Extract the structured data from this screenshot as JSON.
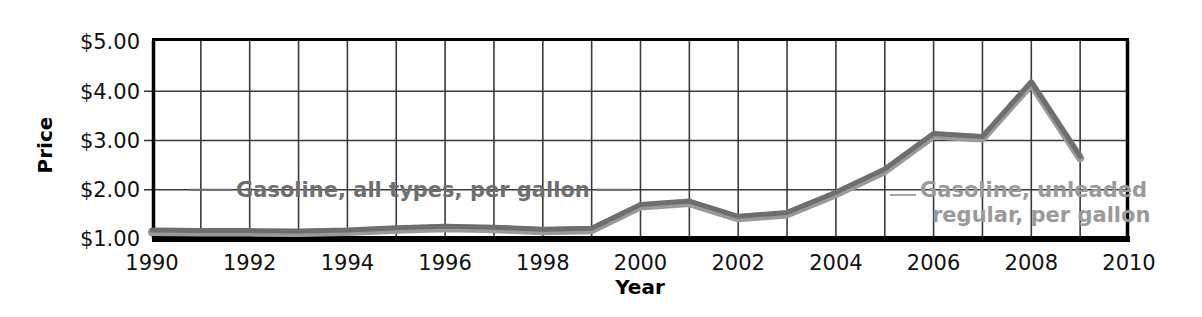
{
  "chart_data": {
    "type": "line",
    "title": "",
    "xlabel": "Year",
    "ylabel": "Price",
    "xlim": [
      1990,
      2010
    ],
    "ylim": [
      1.0,
      5.0
    ],
    "xticks": [
      "1990",
      "1992",
      "1994",
      "1996",
      "1998",
      "2000",
      "2002",
      "2004",
      "2006",
      "2008",
      "2010"
    ],
    "yticks": [
      "$1.00",
      "$2.00",
      "$3.00",
      "$4.00",
      "$5.00"
    ],
    "grid": true,
    "legend_position": "inline-annotations",
    "x": [
      1990,
      1991,
      1992,
      1993,
      1994,
      1995,
      1996,
      1997,
      1998,
      1999,
      2000,
      2001,
      2002,
      2003,
      2004,
      2005,
      2006,
      2007,
      2008,
      2009
    ],
    "series": [
      {
        "name": "Gasoline, all types, per gallon",
        "color": "#6e6e6e",
        "values": [
          1.16,
          1.14,
          1.13,
          1.11,
          1.12,
          1.15,
          1.23,
          1.23,
          1.06,
          1.17,
          1.51,
          1.46,
          1.36,
          1.59,
          1.88,
          2.3,
          2.59,
          2.8,
          3.27,
          2.35
        ]
      },
      {
        "name": "Gasoline, unleaded regular, per gallon",
        "color": "#9a9a9a",
        "values": [
          1.16,
          1.14,
          1.13,
          1.11,
          1.11,
          1.15,
          1.23,
          1.23,
          1.06,
          1.17,
          1.51,
          1.46,
          1.36,
          1.59,
          1.88,
          2.3,
          2.59,
          2.8,
          3.27,
          2.35
        ]
      }
    ],
    "plot_points": {
      "series_a": [
        {
          "year": 1990,
          "price": 1.16
        },
        {
          "year": 1991,
          "price": 1.15
        },
        {
          "year": 1992,
          "price": 1.15
        },
        {
          "year": 1993,
          "price": 1.14
        },
        {
          "year": 1994,
          "price": 1.16
        },
        {
          "year": 1995,
          "price": 1.21
        },
        {
          "year": 1996,
          "price": 1.24
        },
        {
          "year": 1997,
          "price": 1.22
        },
        {
          "year": 1998,
          "price": 1.18
        },
        {
          "year": 1999,
          "price": 1.2
        },
        {
          "year": 2000,
          "price": 1.68
        },
        {
          "year": 2001,
          "price": 1.75
        },
        {
          "year": 2002,
          "price": 1.44
        },
        {
          "year": 2003,
          "price": 1.52
        },
        {
          "year": 2004,
          "price": 1.93
        },
        {
          "year": 2005,
          "price": 2.4
        },
        {
          "year": 2006,
          "price": 3.12
        },
        {
          "year": 2007,
          "price": 3.06
        },
        {
          "year": 2008,
          "price": 4.17
        },
        {
          "year": 2009,
          "price": 2.66
        }
      ]
    },
    "annotations": [
      {
        "id": "annot-all-types",
        "text": "Gasoline, all types, per gallon",
        "color": "#6e6e6e"
      },
      {
        "id": "annot-unleaded-line1",
        "text": "Gasoline, unleaded",
        "color": "#9a9a9a"
      },
      {
        "id": "annot-unleaded-line2",
        "text": "regular, per gallon",
        "color": "#9a9a9a"
      }
    ]
  },
  "axes": {
    "y_label": "Price",
    "x_label": "Year",
    "y_tick_labels": [
      "$5.00",
      "$4.00",
      "$3.00",
      "$2.00",
      "$1.00"
    ],
    "x_tick_labels": [
      "1990",
      "1992",
      "1994",
      "1996",
      "1998",
      "2000",
      "2002",
      "2004",
      "2006",
      "2008",
      "2010"
    ]
  },
  "colors": {
    "series_a": "#6e6e6e",
    "series_b": "#9a9a9a",
    "axis": "#000000",
    "grid": "#3a3a3a",
    "background": "#ffffff"
  }
}
